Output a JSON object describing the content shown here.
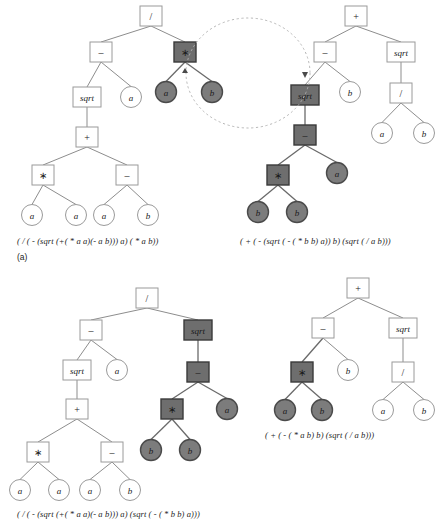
{
  "figure": {
    "panel_label": "(a)",
    "colors": {
      "selected_box_fill": "#6e6e6e",
      "selected_circle_fill": "#7c7c7c",
      "node_stroke": "#9a9a9a",
      "edge": "#8d8d8d",
      "swap_marker": "#b0b0b0",
      "background": "#ffffff"
    }
  },
  "captions": {
    "parent1": "( / ( - (sqrt (+( * a a)(- a b))) a) ( * a b))",
    "parent2": "( + ( - (sqrt ( - ( * b b) a)) b) (sqrt ( / a b)))",
    "child1": "( / ( - (sqrt (+( * a a)(- a b))) a) (sqrt ( - ( * b b) a)))",
    "child2": "( + ( - ( * a b) b) (sqrt ( / a b)))"
  },
  "trees": [
    {
      "id": "parent-1",
      "name": "parent-tree-1",
      "role": "parent",
      "caption_key": "parent1",
      "nodes": [
        {
          "id": "p1-root",
          "label": "/",
          "shape": "box",
          "x": 151,
          "y": 16,
          "selected": false
        },
        {
          "id": "p1-minus",
          "label": "–",
          "shape": "box",
          "x": 101,
          "y": 52,
          "selected": false
        },
        {
          "id": "p1-star",
          "label": "∗",
          "shape": "box",
          "x": 185,
          "y": 52,
          "selected": true
        },
        {
          "id": "p1-sqrt",
          "label": "sqrt",
          "shape": "box",
          "x": 87,
          "y": 97,
          "selected": false
        },
        {
          "id": "p1-a1",
          "label": "a",
          "shape": "circle",
          "x": 131,
          "y": 97,
          "selected": false
        },
        {
          "id": "p1-ga",
          "label": "a",
          "shape": "circle",
          "x": 166,
          "y": 92,
          "selected": true
        },
        {
          "id": "p1-gb",
          "label": "b",
          "shape": "circle",
          "x": 212,
          "y": 92,
          "selected": true
        },
        {
          "id": "p1-plus",
          "label": "+",
          "shape": "box",
          "x": 87,
          "y": 137,
          "selected": false
        },
        {
          "id": "p1-star2",
          "label": "∗",
          "shape": "box",
          "x": 43,
          "y": 175,
          "selected": false
        },
        {
          "id": "p1-minus2",
          "label": "–",
          "shape": "box",
          "x": 127,
          "y": 175,
          "selected": false
        },
        {
          "id": "p1-a2",
          "label": "a",
          "shape": "circle",
          "x": 32,
          "y": 215,
          "selected": false
        },
        {
          "id": "p1-a3",
          "label": "a",
          "shape": "circle",
          "x": 76,
          "y": 215,
          "selected": false
        },
        {
          "id": "p1-a4",
          "label": "a",
          "shape": "circle",
          "x": 104,
          "y": 215,
          "selected": false
        },
        {
          "id": "p1-b1",
          "label": "b",
          "shape": "circle",
          "x": 148,
          "y": 215,
          "selected": false
        }
      ],
      "edges": [
        {
          "from": "p1-root",
          "to": "p1-minus",
          "selected": false
        },
        {
          "from": "p1-root",
          "to": "p1-star",
          "selected": false
        },
        {
          "from": "p1-minus",
          "to": "p1-sqrt",
          "selected": false
        },
        {
          "from": "p1-minus",
          "to": "p1-a1",
          "selected": false
        },
        {
          "from": "p1-star",
          "to": "p1-ga",
          "selected": true
        },
        {
          "from": "p1-star",
          "to": "p1-gb",
          "selected": true
        },
        {
          "from": "p1-sqrt",
          "to": "p1-plus",
          "selected": false
        },
        {
          "from": "p1-plus",
          "to": "p1-star2",
          "selected": false
        },
        {
          "from": "p1-plus",
          "to": "p1-minus2",
          "selected": false
        },
        {
          "from": "p1-star2",
          "to": "p1-a2",
          "selected": false
        },
        {
          "from": "p1-star2",
          "to": "p1-a3",
          "selected": false
        },
        {
          "from": "p1-minus2",
          "to": "p1-a4",
          "selected": false
        },
        {
          "from": "p1-minus2",
          "to": "p1-b1",
          "selected": false
        }
      ]
    },
    {
      "id": "parent-2",
      "name": "parent-tree-2",
      "role": "parent",
      "caption_key": "parent2",
      "nodes": [
        {
          "id": "p2-root",
          "label": "+",
          "shape": "box",
          "x": 356,
          "y": 16,
          "selected": false
        },
        {
          "id": "p2-minus",
          "label": "–",
          "shape": "box",
          "x": 325,
          "y": 52,
          "selected": false
        },
        {
          "id": "p2-sqrtR",
          "label": "sqrt",
          "shape": "box",
          "x": 401,
          "y": 52,
          "selected": false
        },
        {
          "id": "p2-sqrt",
          "label": "sqrt",
          "shape": "box",
          "x": 305,
          "y": 95,
          "selected": true
        },
        {
          "id": "p2-b1",
          "label": "b",
          "shape": "circle",
          "x": 350,
          "y": 92,
          "selected": false
        },
        {
          "id": "p2-div",
          "label": "/",
          "shape": "box",
          "x": 401,
          "y": 93,
          "selected": false
        },
        {
          "id": "p2-a5",
          "label": "a",
          "shape": "circle",
          "x": 382,
          "y": 133,
          "selected": false
        },
        {
          "id": "p2-b5",
          "label": "b",
          "shape": "circle",
          "x": 424,
          "y": 133,
          "selected": false
        },
        {
          "id": "p2-minus2",
          "label": "–",
          "shape": "box",
          "x": 305,
          "y": 135,
          "selected": true
        },
        {
          "id": "p2-star",
          "label": "∗",
          "shape": "box",
          "x": 278,
          "y": 175,
          "selected": true
        },
        {
          "id": "p2-a1",
          "label": "a",
          "shape": "circle",
          "x": 337,
          "y": 173,
          "selected": true
        },
        {
          "id": "p2-b2",
          "label": "b",
          "shape": "circle",
          "x": 258,
          "y": 212,
          "selected": true
        },
        {
          "id": "p2-b3",
          "label": "b",
          "shape": "circle",
          "x": 297,
          "y": 212,
          "selected": true
        }
      ],
      "edges": [
        {
          "from": "p2-root",
          "to": "p2-minus",
          "selected": false
        },
        {
          "from": "p2-root",
          "to": "p2-sqrtR",
          "selected": false
        },
        {
          "from": "p2-minus",
          "to": "p2-sqrt",
          "selected": false
        },
        {
          "from": "p2-minus",
          "to": "p2-b1",
          "selected": false
        },
        {
          "from": "p2-sqrtR",
          "to": "p2-div",
          "selected": false
        },
        {
          "from": "p2-div",
          "to": "p2-a5",
          "selected": false
        },
        {
          "from": "p2-div",
          "to": "p2-b5",
          "selected": false
        },
        {
          "from": "p2-sqrt",
          "to": "p2-minus2",
          "selected": true
        },
        {
          "from": "p2-minus2",
          "to": "p2-star",
          "selected": true
        },
        {
          "from": "p2-minus2",
          "to": "p2-a1",
          "selected": true
        },
        {
          "from": "p2-star",
          "to": "p2-b2",
          "selected": true
        },
        {
          "from": "p2-star",
          "to": "p2-b3",
          "selected": true
        }
      ]
    },
    {
      "id": "child-1",
      "name": "child-tree-1",
      "role": "child",
      "caption_key": "child1",
      "nodes": [
        {
          "id": "c1-root",
          "label": "/",
          "shape": "box",
          "x": 147,
          "y": 298,
          "selected": false
        },
        {
          "id": "c1-minus",
          "label": "–",
          "shape": "box",
          "x": 91,
          "y": 330,
          "selected": false
        },
        {
          "id": "c1-sqrtS",
          "label": "sqrt",
          "shape": "box",
          "x": 198,
          "y": 330,
          "selected": true
        },
        {
          "id": "c1-sqrt",
          "label": "sqrt",
          "shape": "box",
          "x": 77,
          "y": 370,
          "selected": false
        },
        {
          "id": "c1-a1",
          "label": "a",
          "shape": "circle",
          "x": 117,
          "y": 370,
          "selected": false
        },
        {
          "id": "c1-minus2",
          "label": "–",
          "shape": "box",
          "x": 198,
          "y": 372,
          "selected": true
        },
        {
          "id": "c1-plus",
          "label": "+",
          "shape": "box",
          "x": 77,
          "y": 409,
          "selected": false
        },
        {
          "id": "c1-star",
          "label": "∗",
          "shape": "box",
          "x": 172,
          "y": 409,
          "selected": true
        },
        {
          "id": "c1-a2",
          "label": "a",
          "shape": "circle",
          "x": 227,
          "y": 409,
          "selected": true
        },
        {
          "id": "c1-star2",
          "label": "∗",
          "shape": "box",
          "x": 38,
          "y": 452,
          "selected": false
        },
        {
          "id": "c1-minus3",
          "label": "–",
          "shape": "box",
          "x": 112,
          "y": 452,
          "selected": false
        },
        {
          "id": "c1-b1",
          "label": "b",
          "shape": "circle",
          "x": 151,
          "y": 450,
          "selected": true
        },
        {
          "id": "c1-b2",
          "label": "b",
          "shape": "circle",
          "x": 190,
          "y": 450,
          "selected": true
        },
        {
          "id": "c1-a3",
          "label": "a",
          "shape": "circle",
          "x": 20,
          "y": 490,
          "selected": false
        },
        {
          "id": "c1-a4",
          "label": "a",
          "shape": "circle",
          "x": 59,
          "y": 490,
          "selected": false
        },
        {
          "id": "c1-a5",
          "label": "a",
          "shape": "circle",
          "x": 90,
          "y": 490,
          "selected": false
        },
        {
          "id": "c1-b3",
          "label": "b",
          "shape": "circle",
          "x": 130,
          "y": 490,
          "selected": false
        }
      ],
      "edges": [
        {
          "from": "c1-root",
          "to": "c1-minus",
          "selected": false
        },
        {
          "from": "c1-root",
          "to": "c1-sqrtS",
          "selected": false
        },
        {
          "from": "c1-minus",
          "to": "c1-sqrt",
          "selected": false
        },
        {
          "from": "c1-minus",
          "to": "c1-a1",
          "selected": false
        },
        {
          "from": "c1-sqrtS",
          "to": "c1-minus2",
          "selected": true
        },
        {
          "from": "c1-sqrt",
          "to": "c1-plus",
          "selected": false
        },
        {
          "from": "c1-minus2",
          "to": "c1-star",
          "selected": true
        },
        {
          "from": "c1-minus2",
          "to": "c1-a2",
          "selected": true
        },
        {
          "from": "c1-plus",
          "to": "c1-star2",
          "selected": false
        },
        {
          "from": "c1-plus",
          "to": "c1-minus3",
          "selected": false
        },
        {
          "from": "c1-star",
          "to": "c1-b1",
          "selected": true
        },
        {
          "from": "c1-star",
          "to": "c1-b2",
          "selected": true
        },
        {
          "from": "c1-star2",
          "to": "c1-a3",
          "selected": false
        },
        {
          "from": "c1-star2",
          "to": "c1-a4",
          "selected": false
        },
        {
          "from": "c1-minus3",
          "to": "c1-a5",
          "selected": false
        },
        {
          "from": "c1-minus3",
          "to": "c1-b3",
          "selected": false
        }
      ]
    },
    {
      "id": "child-2",
      "name": "child-tree-2",
      "role": "child",
      "caption_key": "child2",
      "nodes": [
        {
          "id": "c2-root",
          "label": "+",
          "shape": "box",
          "x": 358,
          "y": 288,
          "selected": false
        },
        {
          "id": "c2-minus",
          "label": "–",
          "shape": "box",
          "x": 323,
          "y": 328,
          "selected": false
        },
        {
          "id": "c2-sqrt",
          "label": "sqrt",
          "shape": "box",
          "x": 403,
          "y": 328,
          "selected": false
        },
        {
          "id": "c2-star",
          "label": "∗",
          "shape": "box",
          "x": 302,
          "y": 372,
          "selected": true
        },
        {
          "id": "c2-b1",
          "label": "b",
          "shape": "circle",
          "x": 348,
          "y": 370,
          "selected": false
        },
        {
          "id": "c2-div",
          "label": "/",
          "shape": "box",
          "x": 403,
          "y": 372,
          "selected": false
        },
        {
          "id": "c2-a1",
          "label": "a",
          "shape": "circle",
          "x": 285,
          "y": 410,
          "selected": true
        },
        {
          "id": "c2-b2",
          "label": "b",
          "shape": "circle",
          "x": 322,
          "y": 410,
          "selected": true
        },
        {
          "id": "c2-a2",
          "label": "a",
          "shape": "circle",
          "x": 383,
          "y": 410,
          "selected": false
        },
        {
          "id": "c2-b3",
          "label": "b",
          "shape": "circle",
          "x": 424,
          "y": 410,
          "selected": false
        }
      ],
      "edges": [
        {
          "from": "c2-root",
          "to": "c2-minus",
          "selected": false
        },
        {
          "from": "c2-root",
          "to": "c2-sqrt",
          "selected": false
        },
        {
          "from": "c2-minus",
          "to": "c2-star",
          "selected": true
        },
        {
          "from": "c2-minus",
          "to": "c2-b1",
          "selected": false
        },
        {
          "from": "c2-sqrt",
          "to": "c2-div",
          "selected": false
        },
        {
          "from": "c2-star",
          "to": "c2-a1",
          "selected": true
        },
        {
          "from": "c2-star",
          "to": "c2-b2",
          "selected": true
        },
        {
          "from": "c2-div",
          "to": "c2-a2",
          "selected": false
        },
        {
          "from": "c2-div",
          "to": "c2-b3",
          "selected": false
        }
      ]
    }
  ],
  "swap_marker": {
    "name": "crossover-swap-ellipse",
    "cx": 248,
    "cy": 73,
    "rx": 62,
    "ry": 55,
    "arrow_left": {
      "x": 185,
      "y": 68
    },
    "arrow_right": {
      "x": 305,
      "y": 78
    }
  }
}
